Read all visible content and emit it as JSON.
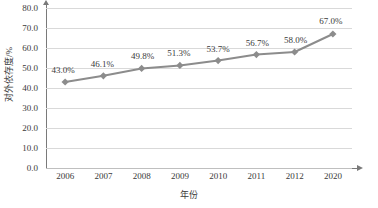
{
  "chart_data": {
    "type": "line",
    "title": "",
    "xlabel": "年份",
    "ylabel": "对外依存度/%",
    "categories": [
      "2006",
      "2007",
      "2008",
      "2009",
      "2010",
      "2011",
      "2012",
      "2020"
    ],
    "values": [
      43.0,
      46.1,
      49.8,
      51.3,
      53.7,
      56.7,
      58.0,
      67.0
    ],
    "point_labels": [
      "43.0%",
      "46.1%",
      "49.8%",
      "51.3%",
      "53.7%",
      "56.7%",
      "58.0%",
      "67.0%"
    ],
    "ylim": [
      0.0,
      80.0
    ],
    "ytick_labels": [
      "0.0",
      "10.0",
      "20.0",
      "30.0",
      "40.0",
      "50.0",
      "60.0",
      "70.0",
      "80.0"
    ],
    "ytick_values": [
      0,
      10,
      20,
      30,
      40,
      50,
      60,
      70,
      80
    ],
    "grid": true,
    "legend": "none",
    "series_color": "#8c8c8c",
    "grid_color": "#d9d9d9",
    "axis_color": "#7a7a7a",
    "text_color": "#3a3a3a",
    "marker": "diamond"
  }
}
